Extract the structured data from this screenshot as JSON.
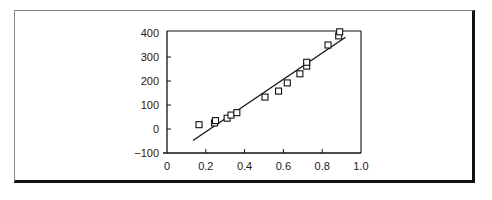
{
  "chart_data": {
    "type": "scatter",
    "title": "",
    "xlabel": "",
    "ylabel": "",
    "xlim": [
      0,
      1.0
    ],
    "ylim": [
      -100,
      400
    ],
    "grid": false,
    "legend": "none",
    "x_ticks": [
      0,
      0.2,
      0.4,
      0.6,
      0.8,
      1.0
    ],
    "x_tick_labels": [
      "0",
      "0.2",
      "0.4",
      "0.6",
      "0.8",
      "1.0"
    ],
    "y_ticks": [
      -100,
      0,
      100,
      200,
      300,
      400
    ],
    "y_tick_labels": [
      "−100",
      "0",
      "100",
      "200",
      "300",
      "400"
    ],
    "series": [
      {
        "name": "observations",
        "marker": "open-square",
        "points": [
          [
            0.165,
            18
          ],
          [
            0.245,
            25
          ],
          [
            0.25,
            35
          ],
          [
            0.31,
            45
          ],
          [
            0.33,
            58
          ],
          [
            0.36,
            68
          ],
          [
            0.505,
            133
          ],
          [
            0.575,
            158
          ],
          [
            0.62,
            192
          ],
          [
            0.685,
            230
          ],
          [
            0.72,
            262
          ],
          [
            0.72,
            278
          ],
          [
            0.83,
            350
          ],
          [
            0.885,
            388
          ],
          [
            0.89,
            405
          ]
        ]
      },
      {
        "name": "fit-line",
        "type": "line",
        "points": [
          [
            0.134,
            -48
          ],
          [
            0.92,
            382
          ]
        ]
      }
    ]
  }
}
